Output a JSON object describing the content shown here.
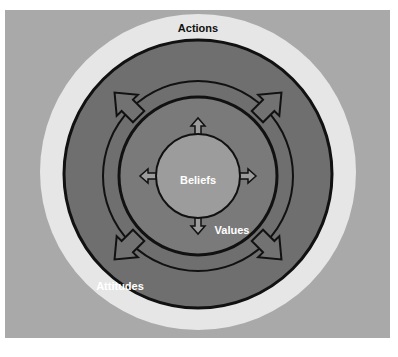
{
  "diagram": {
    "layers": [
      {
        "id": "actions",
        "label": "Actions",
        "color": "#e6e6e6"
      },
      {
        "id": "attitudes",
        "label": "Attitudes",
        "color": "#6f6f6f"
      },
      {
        "id": "values",
        "label": "Values",
        "color": "#7a7a7a"
      },
      {
        "id": "beliefs",
        "label": "Beliefs",
        "color": "#9c9c9c"
      }
    ],
    "background_color": "#a9a9a9",
    "outline_color": "#111111",
    "arrows": {
      "inner_directions": [
        "up",
        "right",
        "down",
        "left"
      ],
      "outer_directions": [
        "up-left",
        "up-right",
        "down-right",
        "down-left"
      ]
    }
  }
}
